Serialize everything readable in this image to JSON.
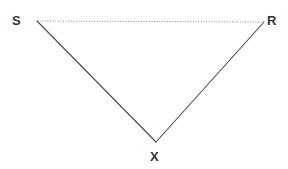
{
  "diagram": {
    "background_color": "#ffffff",
    "solid_stroke_color": "#4a4a4a",
    "dotted_stroke_color": "#8a8a8a",
    "label_color": "#333333",
    "vertices": [
      {
        "name": "S",
        "label": "S",
        "x": 37,
        "y": 21,
        "label_x": 12,
        "label_y": 14
      },
      {
        "name": "R",
        "label": "R",
        "x": 264,
        "y": 22,
        "label_x": 267,
        "label_y": 14
      },
      {
        "name": "X",
        "label": "X",
        "x": 156,
        "y": 142,
        "label_x": 150,
        "label_y": 150
      }
    ],
    "edges": [
      {
        "name": "edge-S-R",
        "from": "S",
        "to": "R",
        "style": "dotted",
        "x1": 37,
        "y1": 21,
        "x2": 264,
        "y2": 22
      },
      {
        "name": "edge-S-X",
        "from": "S",
        "to": "X",
        "style": "solid",
        "x1": 37,
        "y1": 21,
        "x2": 156,
        "y2": 142
      },
      {
        "name": "edge-X-R",
        "from": "X",
        "to": "R",
        "style": "solid",
        "x1": 156,
        "y1": 142,
        "x2": 264,
        "y2": 22
      }
    ]
  }
}
